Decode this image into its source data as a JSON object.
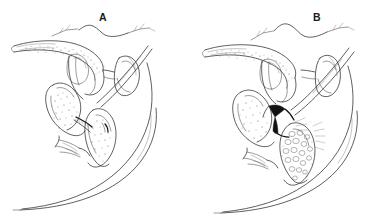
{
  "figure": {
    "type": "scientific-line-illustration",
    "background_color": "#ffffff",
    "ink_color": "#2b2b2b",
    "width": 383,
    "height": 224,
    "caption": "",
    "panels": [
      {
        "id": "A",
        "label": "A",
        "label_x": 99,
        "label_y": 12,
        "description": "Sagittal line drawing of internal genitalia, undistended state; stippled shading on elongate dorsal organ, sac-like ventral organ and curved posterior body wall."
      },
      {
        "id": "B",
        "label": "B",
        "label_x": 313,
        "label_y": 12,
        "description": "Companion sagittal line drawing, distended state; dark wedge-shaped sclerite at mid-region and vesiculate (cell-like) texture in the ventro-posterior organ."
      }
    ]
  }
}
